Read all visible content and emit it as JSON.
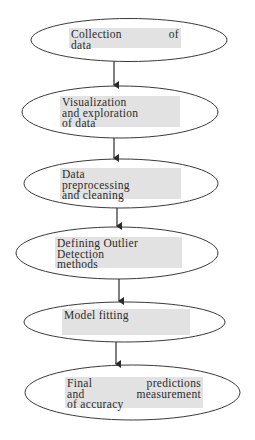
{
  "flowchart": {
    "colors": {
      "stroke": "#3a3a3a",
      "label_background": "#e2e2e2",
      "label_text": "#2b2b2b",
      "background": "#ffffff"
    },
    "nodes": [
      {
        "id": "n1",
        "label": "Collection of data",
        "lines": [
          "Collection of",
          "data"
        ]
      },
      {
        "id": "n2",
        "label": "Visualization and exploration of data",
        "lines": [
          "Visualization",
          "and exploration",
          "of data"
        ]
      },
      {
        "id": "n3",
        "label": "Data preprocessing and cleaning",
        "lines": [
          "Data",
          "preprocessing",
          "and cleaning"
        ]
      },
      {
        "id": "n4",
        "label": "Defining Outlier Detection methods",
        "lines": [
          "Defining Outlier",
          "Detection",
          "methods"
        ]
      },
      {
        "id": "n5",
        "label": "Model fitting",
        "lines": [
          "Model fitting"
        ]
      },
      {
        "id": "n6",
        "label": "Final predictions and measurement of accuracy",
        "lines": [
          "Final predictions",
          "and measurement",
          "of accuracy"
        ]
      }
    ],
    "edges": [
      {
        "from": "n1",
        "to": "n2"
      },
      {
        "from": "n2",
        "to": "n3"
      },
      {
        "from": "n3",
        "to": "n4"
      },
      {
        "from": "n4",
        "to": "n5"
      },
      {
        "from": "n5",
        "to": "n6"
      }
    ]
  }
}
